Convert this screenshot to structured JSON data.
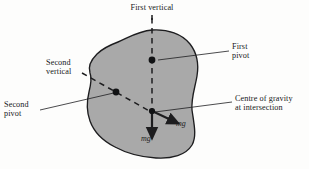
{
  "figure": {
    "background_color": "#fdfdfc",
    "body_fill_color": "#a9a9a9",
    "body_stroke_color": "#1d1d1f",
    "line_color": "#1d1d1f",
    "text_color": "#17181a"
  },
  "labels": {
    "first_vertical": "First vertical",
    "first_pivot_line1": "First",
    "first_pivot_line2": "pivot",
    "second_vertical_line1": "Second",
    "second_vertical_line2": "vertical",
    "second_pivot_line1": "Second",
    "second_pivot_line2": "pivot",
    "centre_of_gravity_line1": "Centre of gravity",
    "centre_of_gravity_line2": "at intersection",
    "weight_vector_vertical": "mg",
    "weight_vector_tilted": "mg"
  },
  "geometry": {
    "first_pivot": {
      "x": 152,
      "y": 60
    },
    "second_pivot": {
      "x": 116,
      "y": 92
    },
    "centre_of_gravity": {
      "x": 152,
      "y": 112
    },
    "first_vertical_line": {
      "x": 152,
      "y_top": 18,
      "y_bottom": 113
    },
    "second_vertical_line": {
      "x1": 82,
      "y1": 73,
      "x2": 152,
      "y2": 113
    },
    "vertical_arrow_tip": {
      "x": 152,
      "y": 134
    },
    "tilted_arrow_tip": {
      "x": 176,
      "y": 124
    }
  }
}
